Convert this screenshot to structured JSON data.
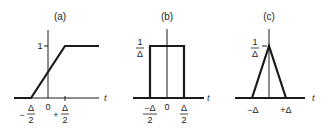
{
  "panels": [
    {
      "id": "a",
      "title": "(a)",
      "axis_label": "t",
      "y_tick": "1",
      "origin_label": "0",
      "x_left": {
        "sign": "−",
        "num": "Δ",
        "den": "2"
      },
      "x_right": {
        "sign": "+",
        "num": "Δ",
        "den": "2"
      },
      "shape": "ramp"
    },
    {
      "id": "b",
      "title": "(b)",
      "axis_label": "t",
      "y_tick": {
        "num": "1",
        "den": "Δ"
      },
      "origin_label": "0",
      "x_left": {
        "num": "−Δ",
        "den": "2"
      },
      "x_right": {
        "num": "Δ",
        "den": "2"
      },
      "shape": "rectangle"
    },
    {
      "id": "c",
      "title": "(c)",
      "axis_label": "t",
      "y_tick": {
        "num": "1",
        "den": "Δ"
      },
      "x_left": "−Δ",
      "x_right": "+Δ",
      "shape": "triangle"
    }
  ],
  "colors": {
    "ink": "#1a1a1a",
    "background": "#ffffff"
  }
}
